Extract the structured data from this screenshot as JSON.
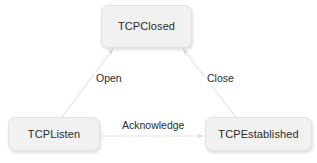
{
  "diagram": {
    "canvas": {
      "width": 317,
      "height": 163,
      "background": "#ffffff"
    },
    "style": {
      "node_fill": "#f1f1f1",
      "node_border": "#e2e2e2",
      "node_text_color": "#2b2b2b",
      "edge_color": "#e0e0e0",
      "edge_label_color": "#2b2b2b"
    },
    "nodes": [
      {
        "id": "tcpclosed",
        "label": "TCPClosed",
        "x": 101,
        "y": 5,
        "width": 91,
        "height": 43
      },
      {
        "id": "tcplisten",
        "label": "TCPListen",
        "x": 8,
        "y": 117,
        "width": 92,
        "height": 34
      },
      {
        "id": "tcpestablished",
        "label": "TCPEstablished",
        "x": 205,
        "y": 117,
        "width": 107,
        "height": 34
      }
    ],
    "edges": [
      {
        "id": "open",
        "label": "Open",
        "from": "tcplisten",
        "to": "tcpclosed",
        "arrowhead": true
      },
      {
        "id": "close",
        "label": "Close",
        "from": "tcpestablished",
        "to": "tcpclosed",
        "arrowhead": true
      },
      {
        "id": "acknowledge",
        "label": "Acknowledge",
        "from": "tcplisten",
        "to": "tcpestablished",
        "arrowhead": true
      }
    ]
  }
}
